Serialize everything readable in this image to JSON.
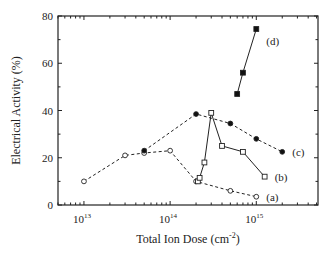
{
  "chart_data": {
    "type": "line",
    "title": "",
    "xlabel": "Total Ion Dose (cm",
    "xlabel_sup": "-2",
    "xlabel_close": ")",
    "ylabel": "Electrical Activity (%)",
    "xscale": "log",
    "xlim": [
      5000000000000.0,
      5200000000000000.0
    ],
    "ylim": [
      0,
      80
    ],
    "yticks": [
      0,
      20,
      40,
      60,
      80
    ],
    "ytick_labels": [
      "0",
      "20",
      "40",
      "60",
      "80"
    ],
    "xticks": [
      10000000000000.0,
      100000000000000.0,
      1000000000000000.0
    ],
    "xtick_labels": [
      {
        "base": "10",
        "exp": "13"
      },
      {
        "base": "10",
        "exp": "14"
      },
      {
        "base": "10",
        "exp": "15"
      }
    ],
    "grid": false,
    "legend": "inline labels",
    "series": [
      {
        "name": "(a)",
        "marker": "open-circle",
        "line": "dashed",
        "points": [
          [
            10000000000000.0,
            10
          ],
          [
            30000000000000.0,
            21
          ],
          [
            50000000000000.0,
            22
          ],
          [
            100000000000000.0,
            23
          ],
          [
            200000000000000.0,
            10
          ],
          [
            500000000000000.0,
            6
          ],
          [
            1000000000000000.0,
            3.5
          ]
        ],
        "label_pos": [
          1000000000000000.0,
          3.5
        ]
      },
      {
        "name": "(b)",
        "marker": "open-square",
        "line": "solid",
        "points": [
          [
            210000000000000.0,
            10
          ],
          [
            220000000000000.0,
            11.5
          ],
          [
            250000000000000.0,
            18
          ],
          [
            300000000000000.0,
            39
          ],
          [
            400000000000000.0,
            25
          ],
          [
            700000000000000.0,
            22.5
          ],
          [
            1250000000000000.0,
            12
          ]
        ],
        "label_pos": [
          1250000000000000.0,
          12
        ]
      },
      {
        "name": "(c)",
        "marker": "filled-circle",
        "line": "dashed",
        "points": [
          [
            50000000000000.0,
            23
          ],
          [
            200000000000000.0,
            38.5
          ],
          [
            500000000000000.0,
            34.5
          ],
          [
            1000000000000000.0,
            28
          ],
          [
            2000000000000000.0,
            22.5
          ]
        ],
        "label_pos": [
          2000000000000000.0,
          22.5
        ]
      },
      {
        "name": "(d)",
        "marker": "filled-square",
        "line": "solid",
        "points": [
          [
            600000000000000.0,
            47
          ],
          [
            700000000000000.0,
            56
          ],
          [
            1000000000000000.0,
            74.5
          ]
        ],
        "label_pos": [
          1000000000000000.0,
          74.5
        ]
      }
    ]
  },
  "layout": {
    "plot": {
      "left": 58,
      "right": 318,
      "top": 16,
      "bottom": 205
    }
  }
}
